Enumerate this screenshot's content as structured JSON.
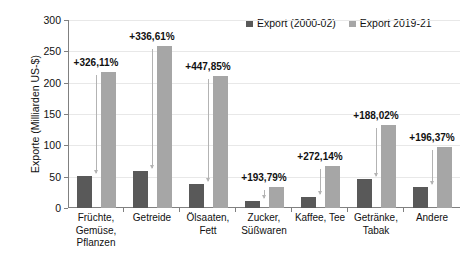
{
  "chart_data": {
    "type": "bar",
    "title": "",
    "xlabel": "",
    "ylabel": "Exporte (Milliarden US-$)",
    "ylim": [
      0,
      300
    ],
    "yticks": [
      0,
      50,
      100,
      150,
      200,
      250,
      300
    ],
    "ytick_labels": [
      "0",
      "50",
      "100",
      "150",
      "200",
      "250",
      "300"
    ],
    "grid": true,
    "legend_position": "top-right",
    "categories": [
      "Früchte, Gemüse, Pflanzen",
      "Getreide",
      "Ölsaaten, Fett",
      "Zucker, Süßwaren",
      "Kaffee, Tee",
      "Getränke, Tabak",
      "Andere"
    ],
    "category_lines": [
      [
        "Früchte,",
        "Gemüse,",
        "Pflanzen"
      ],
      [
        "Getreide"
      ],
      [
        "Ölsaaten,",
        "Fett"
      ],
      [
        "Zucker,",
        "Süßwaren"
      ],
      [
        "Kaffee, Tee"
      ],
      [
        "Getränke,",
        "Tabak"
      ],
      [
        "Andere"
      ]
    ],
    "series": [
      {
        "name": "Export (2000-02)",
        "color": "#595959",
        "values": [
          51,
          59,
          38,
          11,
          18,
          46,
          33
        ]
      },
      {
        "name": "Export 2019-21",
        "color": "#a6a6a6",
        "values": [
          217,
          258,
          210,
          34,
          67,
          133,
          98
        ]
      }
    ],
    "annotations": [
      "+326,11%",
      "+336,61%",
      "+447,85%",
      "+193,79%",
      "+272,14%",
      "+188,02%",
      "+196,37%"
    ]
  },
  "legend": {
    "entries": [
      {
        "label": "Export (2000-02)",
        "color": "#595959"
      },
      {
        "label": "Export 2019-21",
        "color": "#a6a6a6"
      }
    ]
  },
  "colors": {
    "series_old": "#595959",
    "series_new": "#a6a6a6",
    "axis": "#808080",
    "grid": "#e8e8e8",
    "arrow": "#b3b3b3",
    "text": "#111111",
    "background": "#ffffff"
  }
}
